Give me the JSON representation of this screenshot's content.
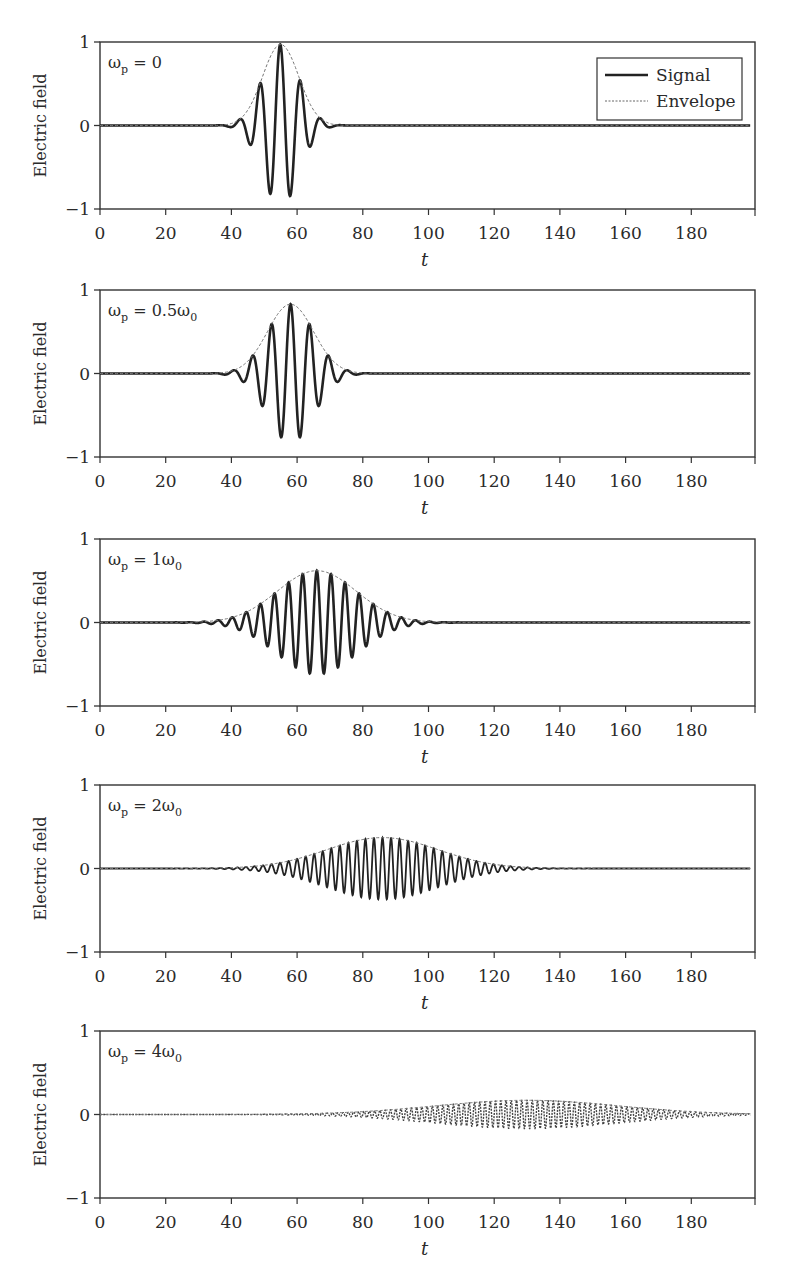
{
  "figure": {
    "ylabel": "Electric field",
    "xlabel": "t",
    "yticks": [
      "1",
      "0",
      "−1"
    ],
    "xticks": [
      "0",
      "20",
      "40",
      "60",
      "80",
      "100",
      "120",
      "140",
      "160",
      "180"
    ],
    "legend": {
      "signal": "Signal",
      "envelope": "Envelope"
    }
  },
  "panels": [
    {
      "label": "ω",
      "sub": "p",
      "rest": " = 0",
      "sub2": ""
    },
    {
      "label": "ω",
      "sub": "p",
      "rest": " = 0.5ω",
      "sub2": "0"
    },
    {
      "label": "ω",
      "sub": "p",
      "rest": " = 1ω",
      "sub2": "0"
    },
    {
      "label": "ω",
      "sub": "p",
      "rest": " = 2ω",
      "sub2": "0"
    },
    {
      "label": "ω",
      "sub": "p",
      "rest": " = 4ω",
      "sub2": "0"
    }
  ],
  "chart_data": [
    {
      "type": "line",
      "title": "ωp = 0",
      "xlabel": "t",
      "ylabel": "Electric field",
      "xlim": [
        0,
        198
      ],
      "ylim": [
        -1,
        1
      ],
      "legend_position": "upper right",
      "series": [
        {
          "name": "Signal",
          "style": "solid",
          "description": "Short pulse centered near t=55",
          "center": 55,
          "width": 5.5,
          "amplitude": 0.97,
          "period": 6.2,
          "peaks": [
            {
              "t": 47,
              "y": 0.2
            },
            {
              "t": 50,
              "y": -0.58
            },
            {
              "t": 53,
              "y": 0.9
            },
            {
              "t": 56,
              "y": -0.97
            },
            {
              "t": 59,
              "y": 0.57
            },
            {
              "t": 62,
              "y": -0.25
            }
          ]
        },
        {
          "name": "Envelope",
          "style": "dotted",
          "center": 55,
          "width": 5.5,
          "peak": 0.97
        }
      ]
    },
    {
      "type": "line",
      "title": "ωp = 0.5ω0",
      "xlabel": "t",
      "ylabel": "Electric field",
      "xlim": [
        0,
        198
      ],
      "ylim": [
        -1,
        1
      ],
      "series": [
        {
          "name": "Signal",
          "style": "solid",
          "center": 58,
          "width": 7,
          "amplitude": 0.83,
          "period": 5.8,
          "peaks": [
            {
              "t": 50,
              "y": 0.27
            },
            {
              "t": 53,
              "y": -0.55
            },
            {
              "t": 55,
              "y": 0.7
            },
            {
              "t": 58,
              "y": -0.83
            },
            {
              "t": 61,
              "y": 0.7
            },
            {
              "t": 64,
              "y": -0.48
            },
            {
              "t": 67,
              "y": 0.2
            }
          ]
        },
        {
          "name": "Envelope",
          "style": "dotted",
          "center": 58,
          "width": 7,
          "peak": 0.83
        }
      ]
    },
    {
      "type": "line",
      "title": "ωp = 1ω0",
      "xlabel": "t",
      "ylabel": "Electric field",
      "xlim": [
        0,
        198
      ],
      "ylim": [
        -1,
        1
      ],
      "series": [
        {
          "name": "Signal",
          "style": "solid",
          "center": 66,
          "width": 12,
          "amplitude": 0.62,
          "period": 4.3
        },
        {
          "name": "Envelope",
          "style": "dotted",
          "center": 66,
          "width": 12,
          "peak": 0.62
        }
      ]
    },
    {
      "type": "line",
      "title": "ωp = 2ω0",
      "xlabel": "t",
      "ylabel": "Electric field",
      "xlim": [
        0,
        198
      ],
      "ylim": [
        -1,
        1
      ],
      "series": [
        {
          "name": "Signal",
          "style": "solid",
          "center": 86,
          "width": 17,
          "amplitude": 0.37,
          "period": 2.6
        },
        {
          "name": "Envelope",
          "style": "dotted",
          "center": 86,
          "width": 17,
          "peak": 0.37
        }
      ]
    },
    {
      "type": "line",
      "title": "ωp = 4ω0",
      "xlabel": "t",
      "ylabel": "Electric field",
      "xlim": [
        0,
        198
      ],
      "ylim": [
        -1,
        1
      ],
      "series": [
        {
          "name": "Signal",
          "style": "dotted",
          "center": 130,
          "width": 28,
          "amplitude": 0.17,
          "period": 1.6
        },
        {
          "name": "Envelope",
          "style": "dotted",
          "center": 130,
          "width": 28,
          "peak": 0.17
        }
      ]
    }
  ]
}
